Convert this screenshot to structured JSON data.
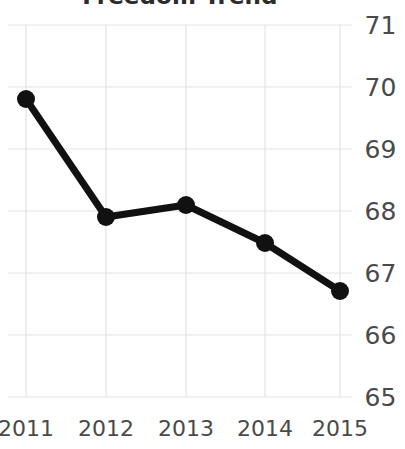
{
  "chart_data": {
    "type": "line",
    "title": "Freedom Trend",
    "xlabel": "",
    "ylabel": "",
    "categories": [
      "2011",
      "2012",
      "2013",
      "2014",
      "2015"
    ],
    "x": [
      2011,
      2012,
      2013,
      2014,
      2015
    ],
    "values": [
      69.8,
      67.9,
      68.1,
      67.65,
      66.7
    ],
    "series": [
      {
        "name": "Freedom Score",
        "values": [
          69.8,
          67.9,
          68.1,
          67.65,
          66.7
        ]
      }
    ],
    "ylim": [
      65,
      71
    ],
    "yticks": [
      71,
      70,
      69,
      68,
      67,
      66,
      65
    ],
    "ytick_labels": [
      "71",
      "70",
      "69",
      "68",
      "67",
      "66",
      "65"
    ],
    "xtick_labels": [
      "2011",
      "2012",
      "2013",
      "2014",
      "2015"
    ],
    "grid": true,
    "grid_axis": "both",
    "legend": false,
    "legend_position": "none",
    "y_axis_position": "right",
    "markers": true,
    "marker_style": "circle",
    "line_color": "#111111",
    "marker_color": "#111111",
    "grid_color": "#e3e3e3",
    "text_color": "#4a4a4a",
    "title_color": "#2b2b2b",
    "background_color": "#ffffff",
    "line_width": 7,
    "marker_size": 9
  },
  "axes": {
    "y_ticks": [
      {
        "label": "71",
        "value": 71,
        "y": 25
      },
      {
        "label": "70",
        "value": 70,
        "y": 87
      },
      {
        "label": "69",
        "value": 69,
        "y": 149
      },
      {
        "label": "68",
        "value": 68,
        "y": 211
      },
      {
        "label": "67",
        "value": 67,
        "y": 273
      },
      {
        "label": "66",
        "value": 66,
        "y": 335
      },
      {
        "label": "65",
        "value": 65,
        "y": 397
      }
    ],
    "x_ticks": [
      {
        "label": "2011",
        "x": 26
      },
      {
        "label": "2012",
        "x": 106
      },
      {
        "label": "2013",
        "x": 186
      },
      {
        "label": "2014",
        "x": 265
      },
      {
        "label": "2015",
        "x": 340
      }
    ]
  },
  "points": [
    {
      "label": "2011",
      "value": 69.8,
      "x": 26,
      "y": 99
    },
    {
      "label": "2012",
      "value": 67.9,
      "x": 106,
      "y": 217
    },
    {
      "label": "2013",
      "value": 68.1,
      "x": 186,
      "y": 205
    },
    {
      "label": "2014",
      "value": 67.65,
      "x": 265,
      "y": 243
    },
    {
      "label": "2015",
      "value": 66.7,
      "x": 340,
      "y": 291
    }
  ]
}
